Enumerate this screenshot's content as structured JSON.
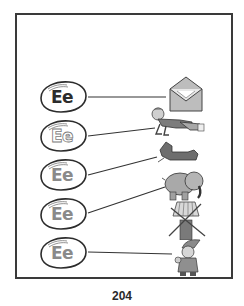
{
  "worksheet": {
    "eggs": [
      {
        "label": "Ee",
        "style": "solid"
      },
      {
        "label": "Ee",
        "style": "outline"
      },
      {
        "label": "Ee",
        "style": "gray"
      },
      {
        "label": "Ee",
        "style": "gray"
      },
      {
        "label": "Ee",
        "style": "gray"
      }
    ],
    "pictures": [
      {
        "name": "envelope"
      },
      {
        "name": "exercise"
      },
      {
        "name": "elbow"
      },
      {
        "name": "elephant"
      },
      {
        "name": "windmill-crossed-out"
      },
      {
        "name": "elf"
      }
    ]
  },
  "footer": {
    "page_number": "204"
  },
  "colors": {
    "border": "#3a3a3a",
    "ink": "#2c2c2c",
    "gray_fill": "#9a9a9a"
  }
}
